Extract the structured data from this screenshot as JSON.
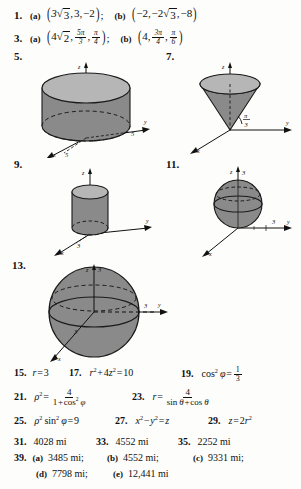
{
  "page": {
    "kind": "textbook-answer-key",
    "topic": "cylindrical and spherical coordinates"
  },
  "answers": [
    {
      "id": "a1",
      "number": "1.",
      "parts": [
        {
          "label": "(a)",
          "text": "(3√3, 3, −2);"
        },
        {
          "label": "(b)",
          "text": "(−2, −2√3, −8)"
        }
      ]
    },
    {
      "id": "a3",
      "number": "3.",
      "parts": [
        {
          "label": "(a)",
          "text": "(4√2, 5π/3, π/4);"
        },
        {
          "label": "(b)",
          "text": "(4, 3π/4, π/6)"
        }
      ]
    },
    {
      "id": "a5",
      "number": "5.",
      "figure": "cylinder-wide"
    },
    {
      "id": "a7",
      "number": "7.",
      "figure": "cone"
    },
    {
      "id": "a9",
      "number": "9.",
      "figure": "cylinder-narrow"
    },
    {
      "id": "a11",
      "number": "11.",
      "figure": "sphere-tangent"
    },
    {
      "id": "a13",
      "number": "13.",
      "figure": "sphere-large"
    },
    {
      "id": "a15",
      "number": "15.",
      "text": "r = 3"
    },
    {
      "id": "a17",
      "number": "17.",
      "text": "r² + 4z² = 10"
    },
    {
      "id": "a19",
      "number": "19.",
      "text": "cos² φ = 1/3"
    },
    {
      "id": "a21",
      "number": "21.",
      "text": "ρ² = 4 / (1 + cos² φ)"
    },
    {
      "id": "a23",
      "number": "23.",
      "text": "r = 4 / (sin θ + cos θ)"
    },
    {
      "id": "a25",
      "number": "25.",
      "text": "ρ² sin² φ = 9"
    },
    {
      "id": "a27",
      "number": "27.",
      "text": "x² − y² = z"
    },
    {
      "id": "a29",
      "number": "29.",
      "text": "z = 2r²"
    },
    {
      "id": "a31",
      "number": "31.",
      "text": "4028 mi"
    },
    {
      "id": "a33",
      "number": "33.",
      "text": "4552 mi"
    },
    {
      "id": "a35",
      "number": "35.",
      "text": "2252 mi"
    },
    {
      "id": "a39",
      "number": "39.",
      "parts": [
        {
          "label": "(a)",
          "text": "3485 mi;"
        },
        {
          "label": "(b)",
          "text": "4552 mi;"
        },
        {
          "label": "(c)",
          "text": "9331 mi;"
        },
        {
          "label": "(d)",
          "text": "7798 mi;"
        },
        {
          "label": "(e)",
          "text": "12,441 mi"
        }
      ]
    }
  ],
  "tokens": {
    "n1": "1.",
    "n3": "3.",
    "n5": "5.",
    "n7": "7.",
    "n9": "9.",
    "n11": "11.",
    "n13": "13.",
    "n15": "15.",
    "n17": "17.",
    "n19": "19.",
    "n21": "21.",
    "n23": "23.",
    "n25": "25.",
    "n27": "27.",
    "n29": "29.",
    "n31": "31.",
    "n33": "33.",
    "n35": "35.",
    "n39": "39.",
    "la": "(a)",
    "lb": "(b)",
    "lc": "(c)",
    "ld": "(d)",
    "le": "(e)",
    "three": "3",
    "two": "2",
    "four": "4",
    "eight": "8",
    "five": "5",
    "six": "6",
    "nine": "9",
    "ten": "10",
    "one": "1",
    "pi": "π",
    "phi": "φ",
    "theta": "θ",
    "rho": "ρ",
    "r": "r",
    "x": "x",
    "y": "y",
    "z": "z",
    "eq": "=",
    "minus": "−",
    "plus": "+",
    "semi": ";",
    "comma": ",",
    "cos": "cos",
    "sin": "sin",
    "mi31": "4028 mi",
    "mi33": "4552 mi",
    "mi35": "2252 mi",
    "mi39a": "3485 mi;",
    "mi39b": "4552 mi;",
    "mi39c": "9331 mi;",
    "mi39d": "7798 mi;",
    "mi39e": "12,441 mi"
  },
  "figures": {
    "cylinder_wide": {
      "axis_x": "x",
      "axis_y": "y",
      "axis_z": "z",
      "label_y": "5",
      "label_x": "5"
    },
    "cone": {
      "axis_x": "x",
      "axis_y": "y",
      "axis_z": "z",
      "angle_num": "π",
      "angle_den": "3"
    },
    "cylinder_narrow": {
      "axis_x": "x",
      "axis_y": "y",
      "axis_z": "z",
      "label_x": "3"
    },
    "sphere_tangent": {
      "axis_x": "x",
      "axis_y": "y",
      "axis_z": "z",
      "label_z": "3",
      "label_y": "3",
      "label_x": "3"
    },
    "sphere_large": {
      "axis_x": "x",
      "axis_y": "y",
      "axis_z": "z",
      "label_z": "3",
      "label_y": "3",
      "label_x": "3"
    }
  },
  "colors": {
    "ink": "#111111",
    "paper": "#fdfdfb",
    "solid_body": "#8a8a8a",
    "solid_top": "#b6b6b6",
    "solid_edge": "#1a1a1a"
  }
}
